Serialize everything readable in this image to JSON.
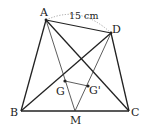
{
  "diagram": {
    "type": "geometry",
    "points": {
      "A": {
        "label": "A",
        "x": 46,
        "y": 20
      },
      "D": {
        "label": "D",
        "x": 111,
        "y": 33
      },
      "B": {
        "label": "B",
        "x": 21,
        "y": 111
      },
      "C": {
        "label": "C",
        "x": 129,
        "y": 111
      },
      "M": {
        "label": "M",
        "x": 75,
        "y": 111
      },
      "G": {
        "label": "G",
        "x": 65,
        "y": 81
      },
      "G2": {
        "label": "G'",
        "x": 88,
        "y": 86
      }
    },
    "segments": [
      [
        "A",
        "B"
      ],
      [
        "B",
        "C"
      ],
      [
        "C",
        "D"
      ],
      [
        "D",
        "A"
      ],
      [
        "A",
        "C"
      ],
      [
        "B",
        "D"
      ],
      [
        "A",
        "M"
      ],
      [
        "D",
        "M"
      ],
      [
        "G",
        "G2"
      ]
    ],
    "measure": {
      "label": "15 cm",
      "between": [
        "A",
        "D"
      ],
      "style": "dotted-arc"
    },
    "colors": {
      "stroke": "#222222",
      "arc": "#999999",
      "background": "#ffffff"
    }
  }
}
